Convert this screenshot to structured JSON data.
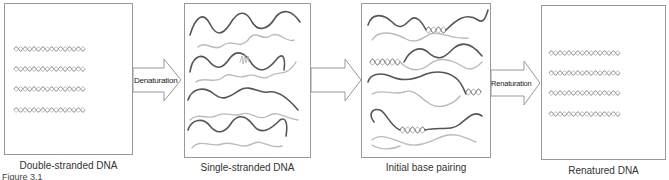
{
  "figure": {
    "label": "Figure 3.1",
    "panels": [
      {
        "id": "double",
        "caption": "Double-stranded DNA"
      },
      {
        "id": "single",
        "caption": "Single-stranded DNA"
      },
      {
        "id": "pairing",
        "caption": "Initial base pairing"
      },
      {
        "id": "renatured",
        "caption": "Renatured DNA"
      }
    ],
    "arrows": [
      {
        "label": "Denaturation"
      },
      {
        "label": ""
      },
      {
        "label": "Renaturation"
      }
    ],
    "colors": {
      "dark_strand": "#555555",
      "light_strand": "#bbbbbb",
      "border": "#999999"
    }
  }
}
